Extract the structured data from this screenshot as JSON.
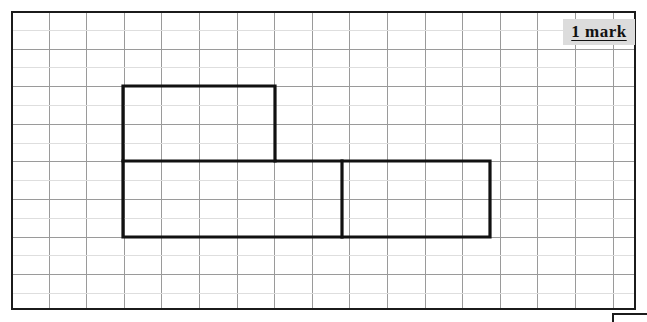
{
  "page": {
    "width": 647,
    "height": 322,
    "background_color": "#ffffff"
  },
  "grid": {
    "name": "squared-grid",
    "x": 11,
    "y": 11,
    "width": 625,
    "height": 299,
    "cell_size": 37.6,
    "columns": 16,
    "rows": 8,
    "minor_horizontal_subdivision": 2,
    "major_line_color": "#9a9a9a",
    "minor_line_color": "#dedede",
    "border_color": "#1b1b1b",
    "border_width": 2
  },
  "shape": {
    "name": "compound-rectilinear-shape",
    "description": "L-shaped / T-shaped compound figure made of rectangles drawn on the grid",
    "stroke_color": "#111111",
    "stroke_width": 3.2,
    "outline_points": [
      [
        123,
        86
      ],
      [
        275,
        86
      ],
      [
        275,
        161
      ],
      [
        490,
        161
      ],
      [
        490,
        237
      ],
      [
        123,
        237
      ]
    ],
    "internal_lines": [
      {
        "name": "horizontal-divider",
        "x1": 123,
        "y1": 161,
        "x2": 275,
        "y2": 161
      },
      {
        "name": "vertical-divider",
        "x1": 342,
        "y1": 161,
        "x2": 342,
        "y2": 237
      }
    ],
    "rectangles": [
      {
        "name": "top-rectangle",
        "x": 123,
        "y": 86,
        "width": 152,
        "height": 75,
        "grid_units": "4 x 2"
      },
      {
        "name": "bottom-left-rectangle",
        "x": 123,
        "y": 161,
        "width": 152,
        "height": 76,
        "grid_units": "4 x 2"
      },
      {
        "name": "bottom-middle-rectangle",
        "x": 275,
        "y": 161,
        "width": 67,
        "height": 76,
        "grid_units": "2 x 2"
      },
      {
        "name": "bottom-right-rectangle",
        "x": 342,
        "y": 161,
        "width": 148,
        "height": 76,
        "grid_units": "4 x 2"
      }
    ]
  },
  "mark_label": {
    "text": "1 mark",
    "background_color": "#dcdcdc",
    "text_color": "#111111",
    "underlined": true,
    "x": 563,
    "y": 19
  },
  "bottom_box_fragment": {
    "name": "answer-box-corner",
    "x": 612,
    "y": 313,
    "border_color": "#1b1b1b"
  }
}
